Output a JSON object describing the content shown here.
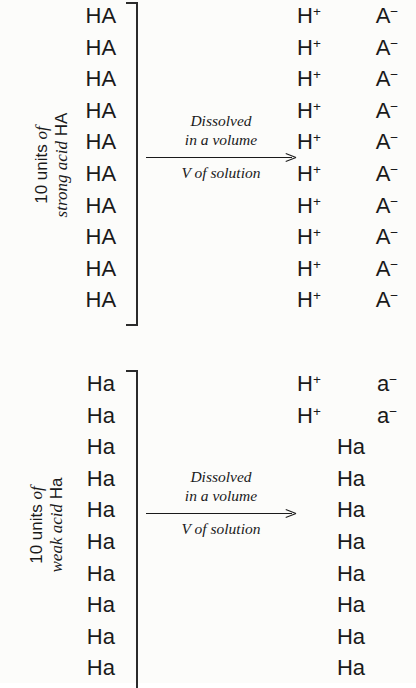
{
  "diagram": {
    "title": "Strong acid versus weak acid dissociation",
    "background_color": "#fcfcfa",
    "text_color": "#1a1a1a"
  },
  "panels": [
    {
      "id": "strong-acid",
      "label": {
        "line1_upright": "10 units",
        "line1_italic": "of",
        "line2_italic": "strong acid",
        "line2_upright": "HA"
      },
      "reactant_formula": "HA",
      "reactant_count": 10,
      "reactants": [
        "HA",
        "HA",
        "HA",
        "HA",
        "HA",
        "HA",
        "HA",
        "HA",
        "HA",
        "HA"
      ],
      "arrow": {
        "above_line1": "Dissolved",
        "above_line2": "in a volume",
        "below": "V of solution"
      },
      "products": [
        {
          "cation": "H",
          "cation_charge": "+",
          "anion": "A",
          "anion_charge": "−"
        },
        {
          "cation": "H",
          "cation_charge": "+",
          "anion": "A",
          "anion_charge": "−"
        },
        {
          "cation": "H",
          "cation_charge": "+",
          "anion": "A",
          "anion_charge": "−"
        },
        {
          "cation": "H",
          "cation_charge": "+",
          "anion": "A",
          "anion_charge": "−"
        },
        {
          "cation": "H",
          "cation_charge": "+",
          "anion": "A",
          "anion_charge": "−"
        },
        {
          "cation": "H",
          "cation_charge": "+",
          "anion": "A",
          "anion_charge": "−"
        },
        {
          "cation": "H",
          "cation_charge": "+",
          "anion": "A",
          "anion_charge": "−"
        },
        {
          "cation": "H",
          "cation_charge": "+",
          "anion": "A",
          "anion_charge": "−"
        },
        {
          "cation": "H",
          "cation_charge": "+",
          "anion": "A",
          "anion_charge": "−"
        },
        {
          "cation": "H",
          "cation_charge": "+",
          "anion": "A",
          "anion_charge": "−"
        }
      ],
      "dissociated_count": 10,
      "undissociated_count": 0,
      "undissociated_formula": ""
    },
    {
      "id": "weak-acid",
      "label": {
        "line1_upright": "10 units",
        "line1_italic": "of",
        "line2_italic": "weak acid",
        "line2_upright": "Ha"
      },
      "reactant_formula": "Ha",
      "reactant_count": 10,
      "reactants": [
        "Ha",
        "Ha",
        "Ha",
        "Ha",
        "Ha",
        "Ha",
        "Ha",
        "Ha",
        "Ha",
        "Ha"
      ],
      "arrow": {
        "above_line1": "Dissolved",
        "above_line2": "in a volume",
        "below": "V of solution"
      },
      "products": [
        {
          "cation": "H",
          "cation_charge": "+",
          "anion": "a",
          "anion_charge": "−"
        },
        {
          "cation": "H",
          "cation_charge": "+",
          "anion": "a",
          "anion_charge": "−"
        },
        {
          "neutral": "Ha"
        },
        {
          "neutral": "Ha"
        },
        {
          "neutral": "Ha"
        },
        {
          "neutral": "Ha"
        },
        {
          "neutral": "Ha"
        },
        {
          "neutral": "Ha"
        },
        {
          "neutral": "Ha"
        },
        {
          "neutral": "Ha"
        }
      ],
      "dissociated_count": 2,
      "undissociated_count": 8,
      "undissociated_formula": "Ha"
    }
  ]
}
